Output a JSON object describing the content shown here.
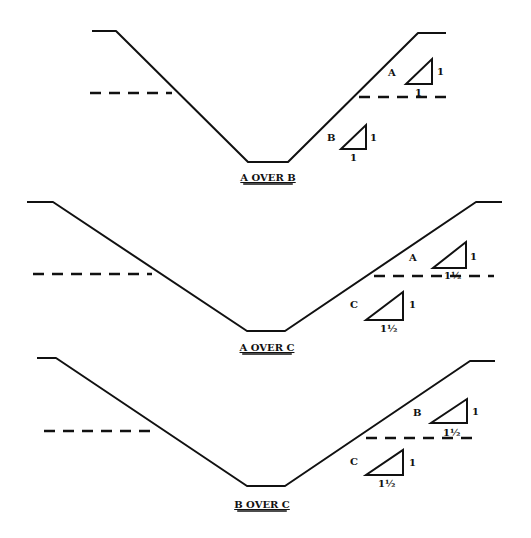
{
  "diagrams": [
    {
      "caption": "A OVER B",
      "profile": "92,31 116,31 248,162 288,162 418,33 446,33",
      "water_left": {
        "x1": 90,
        "x2": 172,
        "y": 93
      },
      "water_right": {
        "x1": 359,
        "x2": 450,
        "y": 97
      },
      "caption_pos": {
        "x": 268,
        "y": 181
      },
      "upper": {
        "label": "A",
        "label_pos": [
          388,
          76
        ],
        "tri": "406,84 432,84 432,59",
        "rise": "1",
        "rise_pos": [
          437,
          75
        ],
        "run": "1",
        "run_pos": [
          415,
          96
        ]
      },
      "lower": {
        "label": "B",
        "label_pos": [
          327,
          141
        ],
        "tri": "341,149 366,149 366,125",
        "rise": "1",
        "rise_pos": [
          370,
          141
        ],
        "run": "1",
        "run_pos": [
          350,
          161
        ]
      }
    },
    {
      "caption": "A OVER C",
      "profile": "27,202 53,202 247,331 285,331 476,202 502,202",
      "water_left": {
        "x1": 33,
        "x2": 152,
        "y": 274
      },
      "water_right": {
        "x1": 374,
        "x2": 494,
        "y": 276
      },
      "caption_pos": {
        "x": 267,
        "y": 351
      },
      "upper": {
        "label": "A",
        "label_pos": [
          409,
          261
        ],
        "tri": "433,268 466,268 466,242",
        "rise": "1",
        "rise_pos": [
          470,
          260
        ],
        "run": "1½",
        "run_pos": [
          444,
          279
        ]
      },
      "lower": {
        "label": "C",
        "label_pos": [
          350,
          308
        ],
        "tri": "366,320 403,320 403,292",
        "rise": "1",
        "rise_pos": [
          409,
          308
        ],
        "run": "1½",
        "run_pos": [
          380,
          332
        ]
      }
    },
    {
      "caption": "B OVER C",
      "profile": "37,358 56,358 247,486 285,486 470,361 495,361",
      "water_left": {
        "x1": 44,
        "x2": 158,
        "y": 431
      },
      "water_right": {
        "x1": 366,
        "x2": 475,
        "y": 438
      },
      "caption_pos": {
        "x": 262,
        "y": 508
      },
      "upper": {
        "label": "B",
        "label_pos": [
          413,
          416
        ],
        "tri": "431,423 467,423 467,399",
        "rise": "1",
        "rise_pos": [
          472,
          415
        ],
        "run": "1½",
        "run_pos": [
          443,
          436
        ]
      },
      "lower": {
        "label": "C",
        "label_pos": [
          350,
          465
        ],
        "tri": "366,475 403,475 403,450",
        "rise": "1",
        "rise_pos": [
          409,
          466
        ],
        "run": "1½",
        "run_pos": [
          378,
          487
        ]
      }
    }
  ],
  "legend": {
    "A": {
      "slope": "1 : 1"
    },
    "B": {
      "slope": "1 : 1 / 1 : 1½"
    },
    "C": {
      "slope": "1 : 1½"
    }
  }
}
